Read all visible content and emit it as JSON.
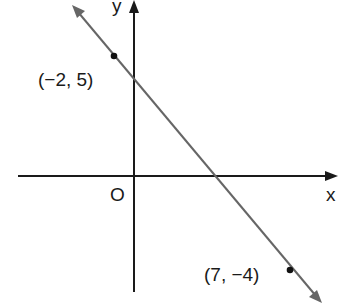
{
  "figure": {
    "type": "coordinate-line-diagram",
    "axes": {
      "x_label": "x",
      "y_label": "y",
      "origin_label": "O"
    },
    "line": {
      "color": "#666666",
      "passes_through": [
        {
          "x": -2,
          "y": 5,
          "label": "(−2, 5)"
        },
        {
          "x": 7,
          "y": -4,
          "label": "(7, −4)"
        }
      ],
      "slope": -1,
      "equation": "y = -x + 3"
    },
    "colors": {
      "axis": "#1a1a1a",
      "line": "#666666",
      "point": "#111111",
      "background": "#ffffff"
    }
  }
}
